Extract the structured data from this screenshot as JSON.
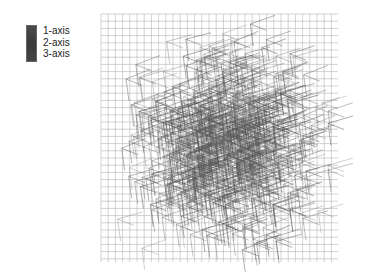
{
  "chart_data": {
    "type": "glyph-field",
    "title": "",
    "xlabel": "",
    "ylabel": "",
    "legend": {
      "position": "top-left",
      "entries": [
        "1-axis",
        "2-axis",
        "3-axis"
      ],
      "color": "#3f3f3f"
    },
    "grid": {
      "on": true,
      "x0": 101,
      "y0": 14,
      "x1": 338,
      "y1": 262,
      "spacing": 7.2,
      "color": "#b5b5b5"
    },
    "glyphs": {
      "description": "Principal-axis tensor glyphs on a regular lattice; density/darkness peaks at center",
      "count_per_side": 14,
      "center": [
        220,
        140
      ],
      "stroke_color": "#555555",
      "axis_length": {
        "vertical": 22,
        "horizontal": 26,
        "diagonal": 18
      }
    }
  }
}
